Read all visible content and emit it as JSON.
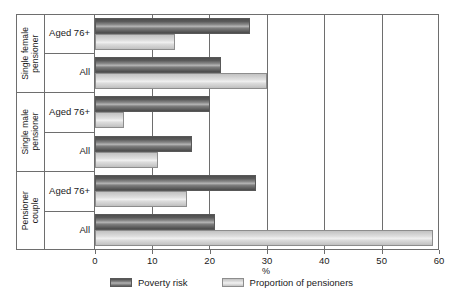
{
  "chart_data": {
    "type": "bar",
    "orientation": "horizontal",
    "title": "",
    "xlabel": "%",
    "ylabel": "",
    "xlim": [
      0,
      60
    ],
    "xticks": [
      0,
      10,
      20,
      30,
      40,
      50,
      60
    ],
    "xtick_labels": [
      "0",
      "10",
      "20",
      "30",
      "40",
      "50",
      "60"
    ],
    "grid": true,
    "legend_position": "bottom",
    "groups": [
      {
        "name": "Single female pensioner",
        "name_lines": "Single female\npensioner",
        "categories": [
          "Aged 76+",
          "All"
        ]
      },
      {
        "name": "Single male pensioner",
        "name_lines": "Single male\npensioner",
        "categories": [
          "Aged 76+",
          "All"
        ]
      },
      {
        "name": "Pensioner couple",
        "name_lines": "Pensioner\ncouple",
        "categories": [
          "Aged 76+",
          "All"
        ]
      }
    ],
    "categories": [
      "Single female pensioner - Aged 76+",
      "Single female pensioner - All",
      "Single male pensioner - Aged 76+",
      "Single male pensioner - All",
      "Pensioner couple - Aged 76+",
      "Pensioner couple - All"
    ],
    "series": [
      {
        "name": "Poverty risk",
        "color": "#6e6e6e",
        "values": [
          27,
          22,
          20,
          17,
          28,
          21
        ]
      },
      {
        "name": "Proportion of pensioners",
        "color": "#dcdcdc",
        "values": [
          14,
          30,
          5,
          11,
          16,
          59
        ]
      }
    ]
  },
  "legend": {
    "items": [
      {
        "label": "Poverty risk",
        "style": "dark"
      },
      {
        "label": "Proportion of pensioners",
        "style": "light"
      }
    ]
  }
}
